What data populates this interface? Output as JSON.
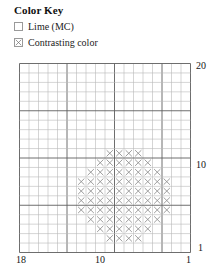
{
  "color_key": {
    "title": "Color Key",
    "entries": [
      {
        "label": "Lime (MC)",
        "symbol": "empty",
        "swatch_name": "swatch-empty"
      },
      {
        "label": "Contrasting color",
        "symbol": "x",
        "swatch_name": "swatch-x"
      }
    ]
  },
  "chart_data": {
    "type": "heatmap",
    "title": "Color Key",
    "xlabel": "",
    "ylabel": "",
    "grid": true,
    "legend_position": "top-left",
    "columns": 18,
    "rows": 20,
    "x_direction": "right-to-left",
    "y_direction": "bottom-to-top",
    "x_tick_labels": [
      "18",
      "10",
      "1"
    ],
    "y_tick_labels": [
      "20",
      "10",
      "1"
    ],
    "xlim": [
      18,
      1
    ],
    "ylim": [
      1,
      20
    ],
    "major_gridline_every": 5,
    "symbols": {
      "0": "empty",
      "1": "x"
    },
    "series": [
      {
        "name": "Contrasting color",
        "symbol": "x",
        "filled_rows_top_to_bottom": [
          [],
          [],
          [],
          [],
          [],
          [],
          [],
          [],
          [],
          [
            10,
            11,
            12,
            13
          ],
          [
            9,
            10,
            11,
            12,
            13,
            14
          ],
          [
            8,
            9,
            10,
            11,
            12,
            13,
            14,
            15
          ],
          [
            7,
            8,
            9,
            10,
            11,
            12,
            13,
            14,
            15,
            16
          ],
          [
            7,
            8,
            9,
            10,
            11,
            12,
            13,
            14,
            15,
            16
          ],
          [
            7,
            8,
            9,
            10,
            11,
            12,
            13,
            14,
            15,
            16
          ],
          [
            7,
            8,
            9,
            10,
            11,
            12,
            13,
            14,
            15,
            16
          ],
          [
            8,
            9,
            10,
            11,
            12,
            13,
            14,
            15
          ],
          [
            9,
            10,
            11,
            12,
            13,
            14
          ],
          [
            10,
            11,
            12,
            13
          ],
          []
        ]
      }
    ]
  },
  "axis": {
    "y_top": "20",
    "y_mid": "10",
    "y_bottom": "1",
    "x_left": "18",
    "x_mid": "10",
    "x_right": "1"
  }
}
